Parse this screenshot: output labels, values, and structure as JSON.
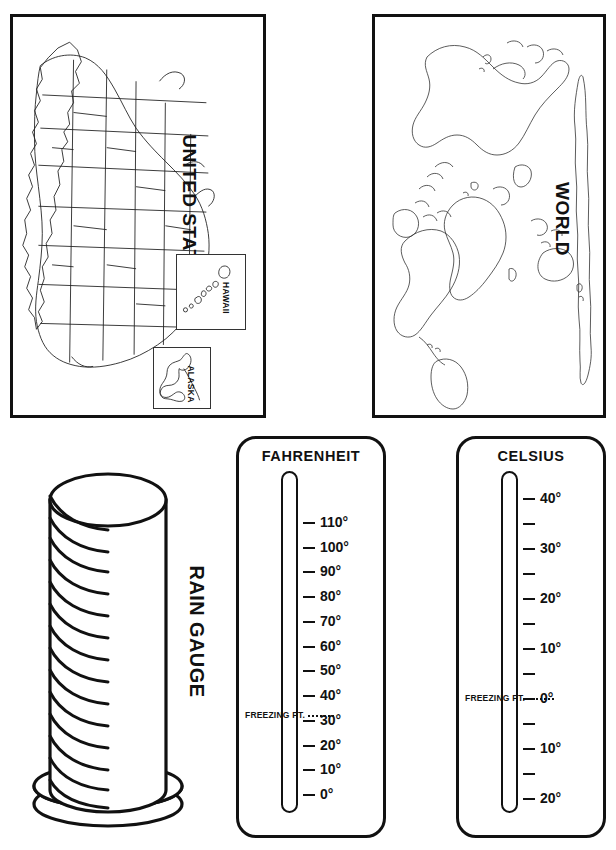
{
  "page": {
    "background_color": "#ffffff",
    "ink_color": "#111111"
  },
  "panels": {
    "united_states_map": {
      "title": "UNITED STATES",
      "title_rotation_deg": 90,
      "insets": [
        {
          "name": "hawaii-inset",
          "label": "HAWAII"
        },
        {
          "name": "alaska-inset",
          "label": "ALASKA"
        }
      ]
    },
    "world_map": {
      "title": "WORLD",
      "title_rotation_deg": 90
    },
    "rain_gauge": {
      "title": "RAIN GAUGE",
      "title_rotation_deg": 90,
      "graduation_marks": 15
    }
  },
  "chart_data": [
    {
      "type": "scale",
      "name": "fahrenheit-thermometer",
      "title": "FAHRENHEIT",
      "unit": "°F",
      "ylim": [
        0,
        110
      ],
      "tick_step": 10,
      "freezing_point_label": "FREEZING PT.",
      "freezing_point_value": 32,
      "ticks": [
        {
          "value": 110,
          "label": "110°"
        },
        {
          "value": 100,
          "label": "100°"
        },
        {
          "value": 90,
          "label": "90°"
        },
        {
          "value": 80,
          "label": "80°"
        },
        {
          "value": 70,
          "label": "70°"
        },
        {
          "value": 60,
          "label": "60°"
        },
        {
          "value": 50,
          "label": "50°"
        },
        {
          "value": 40,
          "label": "40°"
        },
        {
          "value": 30,
          "label": "30°"
        },
        {
          "value": 20,
          "label": "20°"
        },
        {
          "value": 10,
          "label": "10°"
        },
        {
          "value": 0,
          "label": "0°"
        }
      ]
    },
    {
      "type": "scale",
      "name": "celsius-thermometer",
      "title": "CELSIUS",
      "unit": "°C",
      "ylim": [
        -25,
        45
      ],
      "tick_step": 5,
      "freezing_point_label": "FREEZING PT.",
      "freezing_point_value": 0,
      "ticks": [
        {
          "value": 40,
          "label": "40°"
        },
        {
          "value": 35,
          "label": ""
        },
        {
          "value": 30,
          "label": "30°"
        },
        {
          "value": 25,
          "label": ""
        },
        {
          "value": 20,
          "label": "20°"
        },
        {
          "value": 15,
          "label": ""
        },
        {
          "value": 10,
          "label": "10°"
        },
        {
          "value": 5,
          "label": ""
        },
        {
          "value": 0,
          "label": "0°"
        },
        {
          "value": -5,
          "label": ""
        },
        {
          "value": -10,
          "label": "10°"
        },
        {
          "value": -15,
          "label": ""
        },
        {
          "value": -20,
          "label": "20°"
        }
      ]
    }
  ]
}
